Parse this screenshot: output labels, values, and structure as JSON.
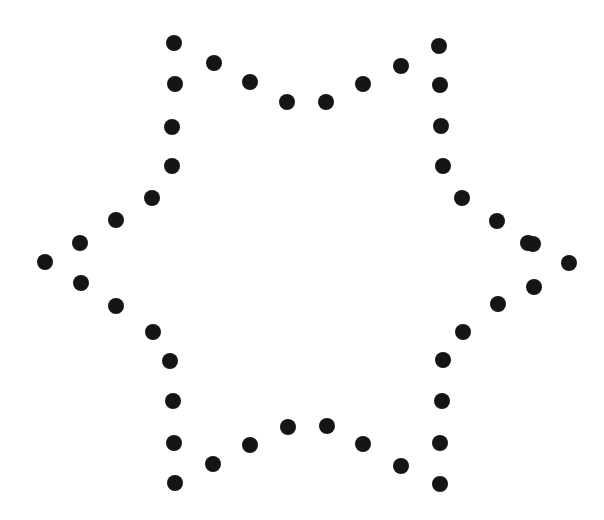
{
  "figure": {
    "width": 604,
    "height": 520,
    "background_color": "#ffffff",
    "dot_color": "#151515",
    "dot_diameter": 16,
    "dot_count": 48,
    "shape": "six-pointed-star",
    "center": {
      "x": 306,
      "y": 264
    }
  },
  "chart_data": {
    "type": "scatter",
    "xlabel": "",
    "ylabel": "",
    "xlim": [
      0,
      604
    ],
    "ylim": [
      0,
      520
    ],
    "grid": false,
    "legend": "none",
    "marker": {
      "shape": "circle",
      "size": 16,
      "color": "#151515"
    },
    "series": [
      {
        "name": "star-outline-dots",
        "points": [
          {
            "x": 174,
            "y": 43
          },
          {
            "x": 214,
            "y": 63
          },
          {
            "x": 250,
            "y": 82
          },
          {
            "x": 287,
            "y": 102
          },
          {
            "x": 326,
            "y": 102
          },
          {
            "x": 363,
            "y": 84
          },
          {
            "x": 401,
            "y": 66
          },
          {
            "x": 439,
            "y": 46
          },
          {
            "x": 440,
            "y": 85
          },
          {
            "x": 441,
            "y": 126
          },
          {
            "x": 443,
            "y": 166
          },
          {
            "x": 462,
            "y": 198
          },
          {
            "x": 497,
            "y": 221
          },
          {
            "x": 528,
            "y": 243
          },
          {
            "x": 533,
            "y": 244
          },
          {
            "x": 569,
            "y": 263
          },
          {
            "x": 534,
            "y": 287
          },
          {
            "x": 498,
            "y": 304
          },
          {
            "x": 463,
            "y": 332
          },
          {
            "x": 443,
            "y": 360
          },
          {
            "x": 442,
            "y": 401
          },
          {
            "x": 440,
            "y": 443
          },
          {
            "x": 440,
            "y": 484
          },
          {
            "x": 401,
            "y": 466
          },
          {
            "x": 363,
            "y": 444
          },
          {
            "x": 327,
            "y": 426
          },
          {
            "x": 288,
            "y": 427
          },
          {
            "x": 250,
            "y": 445
          },
          {
            "x": 213,
            "y": 464
          },
          {
            "x": 175,
            "y": 483
          },
          {
            "x": 174,
            "y": 443
          },
          {
            "x": 173,
            "y": 401
          },
          {
            "x": 170,
            "y": 361
          },
          {
            "x": 153,
            "y": 332
          },
          {
            "x": 116,
            "y": 306
          },
          {
            "x": 81,
            "y": 283
          },
          {
            "x": 45,
            "y": 262
          },
          {
            "x": 80,
            "y": 243
          },
          {
            "x": 116,
            "y": 220
          },
          {
            "x": 152,
            "y": 198
          },
          {
            "x": 172,
            "y": 166
          },
          {
            "x": 172,
            "y": 127
          },
          {
            "x": 175,
            "y": 84
          }
        ]
      }
    ],
    "annotations": {
      "outer_tips": [
        {
          "label": "upper-left-point",
          "x": 174,
          "y": 43
        },
        {
          "label": "upper-right-point",
          "x": 439,
          "y": 46
        },
        {
          "label": "right-point",
          "x": 569,
          "y": 263
        },
        {
          "label": "lower-right-point",
          "x": 440,
          "y": 484
        },
        {
          "label": "lower-left-point",
          "x": 175,
          "y": 483
        },
        {
          "label": "left-point",
          "x": 45,
          "y": 262
        }
      ],
      "inner_vertices": [
        {
          "label": "top-inner-left",
          "x": 287,
          "y": 102
        },
        {
          "label": "top-inner-right",
          "x": 326,
          "y": 102
        },
        {
          "label": "right-inner-upper",
          "x": 497,
          "y": 221
        },
        {
          "label": "right-inner-lower",
          "x": 498,
          "y": 304
        },
        {
          "label": "bottom-inner-right",
          "x": 327,
          "y": 426
        },
        {
          "label": "bottom-inner-left",
          "x": 288,
          "y": 427
        },
        {
          "label": "left-inner-lower",
          "x": 116,
          "y": 306
        },
        {
          "label": "left-inner-upper",
          "x": 116,
          "y": 220
        }
      ]
    }
  }
}
